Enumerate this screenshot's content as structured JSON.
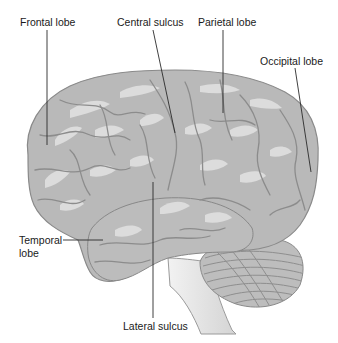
{
  "figure": {
    "colors": {
      "background": "#ffffff",
      "cortex_fill": "#b9b9b9",
      "cortex_highlight": "#dcdcdc",
      "sulcus_line": "#8c8c8c",
      "cerebellum_fill": "#bdbdbd",
      "brainstem_fill": "#e6e6e6",
      "leader_line": "#2a2a2a",
      "label_text": "#1a1a1a"
    }
  },
  "labels": {
    "frontal_lobe": "Frontal lobe",
    "central_sulcus": "Central sulcus",
    "parietal_lobe": "Parietal lobe",
    "occipital_lobe": "Occipital lobe",
    "temporal_lobe_line1": "Temporal",
    "temporal_lobe_line2": "lobe",
    "lateral_sulcus": "Lateral sulcus"
  }
}
